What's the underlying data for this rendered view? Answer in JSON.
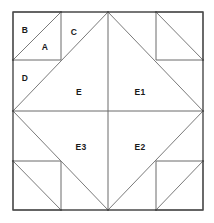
{
  "diagram": {
    "kind": "quilt-block-piecing-diagram",
    "canvas": {
      "width": 214,
      "height": 223
    },
    "colors": {
      "background": "#ffffff",
      "outer_border": "#4a4a4a",
      "inner_line": "#6b6b6b",
      "diagonal_line": "#7a7a7a",
      "label_text": "#1a1a1a"
    },
    "block": {
      "left": 13,
      "top": 12,
      "right": 203,
      "bottom": 210,
      "center_x": 108,
      "center_y": 111,
      "division_x": [
        13,
        61,
        108,
        156,
        203
      ],
      "division_y": [
        12,
        60,
        111,
        161,
        210
      ]
    },
    "labels": [
      {
        "id": "B",
        "text": "B",
        "x": 25,
        "y": 31,
        "region": "top-left-corner-upper-triangle"
      },
      {
        "id": "A",
        "text": "A",
        "x": 45,
        "y": 48,
        "region": "top-left-corner-lower-triangle"
      },
      {
        "id": "C",
        "text": "C",
        "x": 74,
        "y": 33,
        "region": "top-center-left-triangle"
      },
      {
        "id": "D",
        "text": "D",
        "x": 25,
        "y": 79,
        "region": "left-center-upper-triangle"
      },
      {
        "id": "E",
        "text": "E",
        "x": 79,
        "y": 93,
        "region": "center-diamond-upper-left-quarter"
      },
      {
        "id": "E1",
        "text": "E1",
        "x": 140,
        "y": 93,
        "region": "center-diamond-upper-right-quarter"
      },
      {
        "id": "E3",
        "text": "E3",
        "x": 81,
        "y": 148,
        "region": "center-diamond-lower-left-quarter"
      },
      {
        "id": "E2",
        "text": "E2",
        "x": 140,
        "y": 148,
        "region": "center-diamond-lower-right-quarter"
      }
    ],
    "outer_border_path": "M13,12 L203,12 L203,210 L13,210 Z",
    "diamond_path": "M108,12 L203,111 L108,210 L13,111 Z",
    "center_cross": {
      "vertical": "M108,12 L108,210",
      "horizontal": "M13,111 L203,111"
    },
    "corner_squares": [
      {
        "name": "top-left",
        "path": "M13,12 L61,12 L61,60 L13,60 Z",
        "diagonal": "M61,12 L13,60"
      },
      {
        "name": "top-right",
        "path": "M156,12 L203,12 L203,60 L156,60 Z",
        "diagonal": "M156,12 L203,60"
      },
      {
        "name": "bottom-left",
        "path": "M13,161 L61,161 L61,210 L13,210 Z",
        "diagonal": "M13,161 L61,210"
      },
      {
        "name": "bottom-right",
        "path": "M156,161 L203,161 L203,210 L156,210 Z",
        "diagonal": "M156,210 L203,161"
      }
    ],
    "edge_diagonals": [
      {
        "name": "top-left-to-apex",
        "path": "M61,12 L13,60"
      },
      {
        "name": "apex-down-left",
        "path": "M108,12 L13,111"
      },
      {
        "name": "apex-down-right",
        "path": "M108,12 L203,111"
      },
      {
        "name": "bottom-left-rise",
        "path": "M13,111 L108,210"
      },
      {
        "name": "bottom-right-rise",
        "path": "M203,111 L108,210"
      }
    ],
    "vertex_dots": [
      {
        "x": 108,
        "y": 12
      },
      {
        "x": 203,
        "y": 111
      },
      {
        "x": 108,
        "y": 210
      },
      {
        "x": 13,
        "y": 111
      },
      {
        "x": 61,
        "y": 12
      },
      {
        "x": 156,
        "y": 12
      },
      {
        "x": 13,
        "y": 60
      },
      {
        "x": 203,
        "y": 60
      },
      {
        "x": 13,
        "y": 161
      },
      {
        "x": 203,
        "y": 161
      },
      {
        "x": 61,
        "y": 210
      },
      {
        "x": 156,
        "y": 210
      }
    ]
  }
}
